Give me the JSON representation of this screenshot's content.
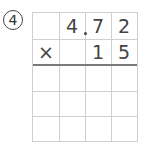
{
  "problem": {
    "number_label": "4",
    "circled": "④",
    "rows": [
      [
        "",
        "4",
        "7",
        "2"
      ],
      [
        "×",
        "",
        "1",
        "5"
      ]
    ],
    "decimal_after_col": 1,
    "answer_rows": 3,
    "columns": 4
  }
}
